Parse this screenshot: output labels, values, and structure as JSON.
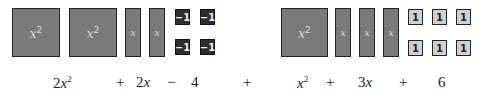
{
  "left_group": {
    "x2_tiles": [
      {
        "label": "x",
        "exp": "2"
      },
      {
        "label": "x",
        "exp": "2"
      }
    ],
    "x_tiles": [
      {
        "label": "x"
      },
      {
        "label": "x"
      }
    ],
    "unit_tiles": [
      {
        "label": "−1"
      },
      {
        "label": "−1"
      },
      {
        "label": "−1"
      },
      {
        "label": "−1"
      }
    ]
  },
  "right_group": {
    "x2_tiles": [
      {
        "label": "x",
        "exp": "2"
      }
    ],
    "x_tiles": [
      {
        "label": "x"
      },
      {
        "label": "x"
      },
      {
        "label": "x"
      }
    ],
    "unit_tiles": [
      {
        "label": "1"
      },
      {
        "label": "1"
      },
      {
        "label": "1"
      },
      {
        "label": "1"
      },
      {
        "label": "1"
      },
      {
        "label": "1"
      }
    ]
  },
  "expression": {
    "t1_coef": "2",
    "t1_var": "x",
    "t1_exp": "2",
    "op1": "+",
    "t2_coef": "2",
    "t2_var": "x",
    "op2": "−",
    "t3": "4",
    "op_mid": "+",
    "t4_var": "x",
    "t4_exp": "2",
    "op3": "+",
    "t5_coef": "3",
    "t5_var": "x",
    "op4": "+",
    "t6": "6"
  },
  "colors": {
    "x2_tile": "#7a7a7a",
    "x_tile": "#7a7a7a",
    "neg_unit_tile": "#2e2e2e",
    "pos_unit_tile": "#cfcfcf"
  }
}
